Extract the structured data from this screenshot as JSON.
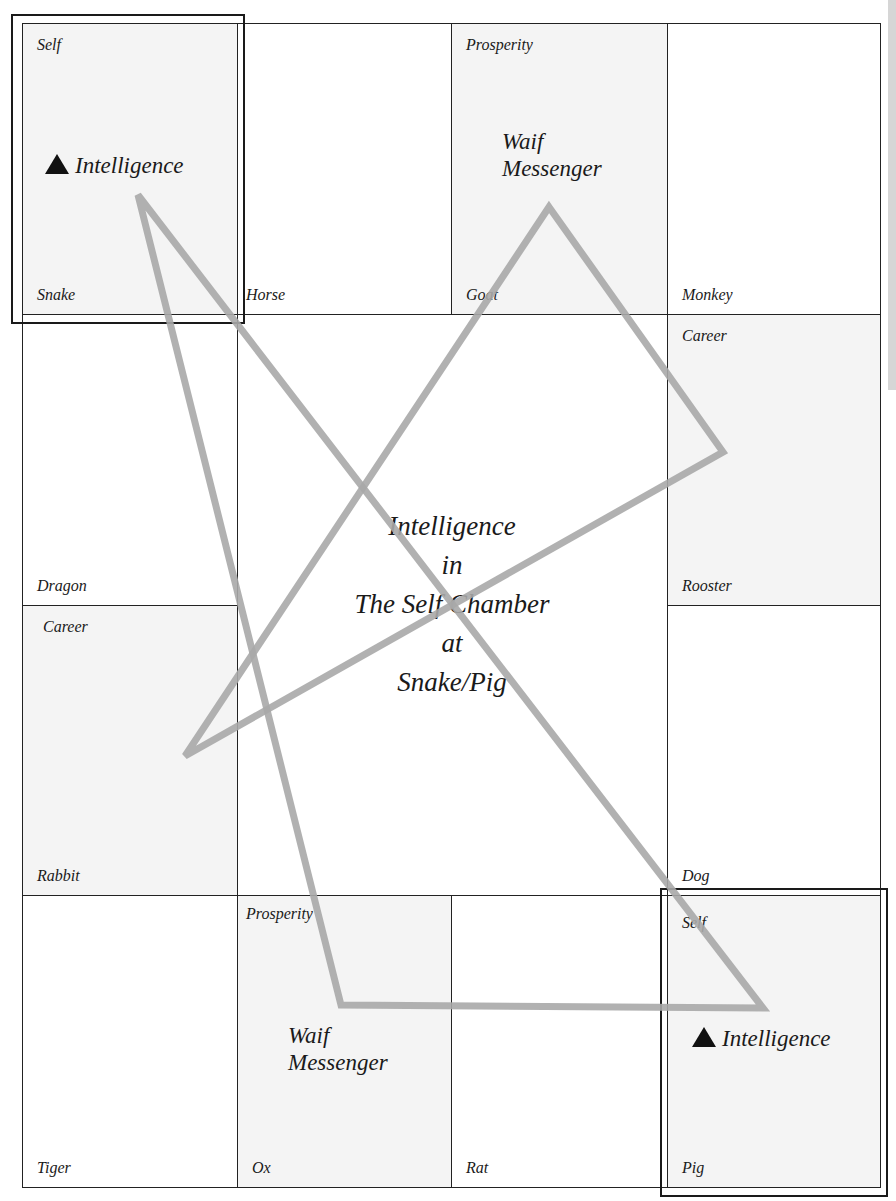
{
  "diagram": {
    "title_lines": [
      "Intelligence",
      "in",
      "The Self Chamber",
      "at",
      "Snake/Pig"
    ],
    "cells": {
      "snake": {
        "top_label": "Self",
        "bottom_label": "Snake",
        "star_label": "Intelligence",
        "shaded": true,
        "highlighted": true
      },
      "horse": {
        "top_label": "",
        "bottom_label": "Horse",
        "shaded": false
      },
      "goat": {
        "top_label": "Prosperity",
        "bottom_label": "Goat",
        "star_label": "Waif\nMessenger",
        "shaded": true
      },
      "monkey": {
        "top_label": "",
        "bottom_label": "Monkey",
        "shaded": false
      },
      "dragon": {
        "top_label": "",
        "bottom_label": "Dragon",
        "shaded": false
      },
      "rooster": {
        "top_label": "Career",
        "bottom_label": "Rooster",
        "shaded": true
      },
      "rabbit": {
        "top_label": "Career",
        "bottom_label": "Rabbit",
        "shaded": true
      },
      "dog": {
        "top_label": "",
        "bottom_label": "Dog",
        "shaded": false
      },
      "tiger": {
        "top_label": "",
        "bottom_label": "Tiger",
        "shaded": false
      },
      "ox": {
        "top_label": "Prosperity",
        "bottom_label": "Ox",
        "star_label": "Waif\nMessenger",
        "shaded": true
      },
      "rat": {
        "top_label": "",
        "bottom_label": "Rat",
        "shaded": false
      },
      "pig": {
        "top_label": "Self",
        "bottom_label": "Pig",
        "star_label": "Intelligence",
        "shaded": true,
        "highlighted": true
      }
    },
    "star_marker_icon": "black-up-triangle",
    "triangles": [
      {
        "name": "triangle-a",
        "points": "138,195 763,1008 341,1005",
        "color": "#a8a8a8"
      },
      {
        "name": "triangle-b",
        "points": "549,207 723,452 185,756",
        "color": "#a8a8a8"
      }
    ],
    "colors": {
      "line": "#222222",
      "shade": "#f4f4f4",
      "overlay": "#a8a8a8"
    }
  }
}
